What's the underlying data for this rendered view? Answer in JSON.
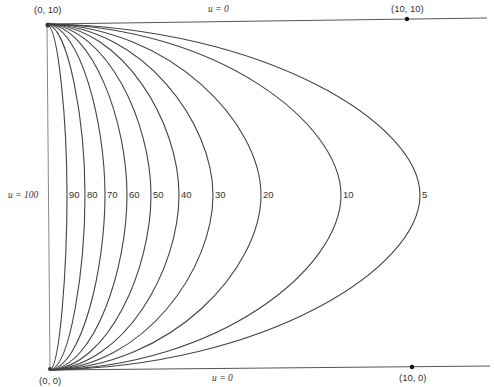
{
  "diagram": {
    "corner_labels": {
      "top_left": "(0, 10)",
      "top_right": "(10, 10)",
      "bottom_left": "(0, 0)",
      "bottom_right": "(10, 0)"
    },
    "boundary_labels": {
      "top": "u = 0",
      "bottom": "u = 0",
      "left": "u = 100"
    },
    "curves": [
      {
        "value": "90",
        "label": "90",
        "peak_x": 67
      },
      {
        "value": "80",
        "label": "80",
        "peak_x": 85
      },
      {
        "value": "70",
        "label": "70",
        "peak_x": 105
      },
      {
        "value": "60",
        "label": "60",
        "peak_x": 127
      },
      {
        "value": "50",
        "label": "50",
        "peak_x": 151
      },
      {
        "value": "40",
        "label": "40",
        "peak_x": 179
      },
      {
        "value": "30",
        "label": "30",
        "peak_x": 213
      },
      {
        "value": "20",
        "label": "20",
        "peak_x": 261
      },
      {
        "value": "10",
        "label": "10",
        "peak_x": 341
      },
      {
        "value": "5",
        "label": "5",
        "peak_x": 420
      }
    ],
    "stroke_color": "#444444"
  }
}
